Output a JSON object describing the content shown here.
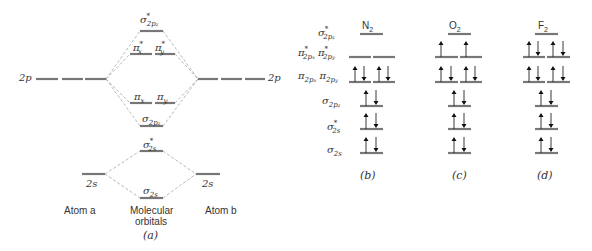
{
  "panel_a": {
    "caption": "(a)",
    "atom_a_label": "Atom a",
    "atom_b_label": "Atom b",
    "molecular_label_line1": "Molecular",
    "molecular_label_line2": "orbitals",
    "atomic_levels": {
      "left_2p": "2p",
      "right_2p": "2p",
      "left_2s": "2s",
      "right_2s": "2s"
    },
    "mo_levels": [
      {
        "name": "sigma*2pz",
        "label": "σ",
        "sub": "2p",
        "subsub": "z",
        "star": true
      },
      {
        "name": "pi*x",
        "label": "π",
        "sub": "x",
        "star": true
      },
      {
        "name": "pi*y",
        "label": "π",
        "sub": "y",
        "star": true
      },
      {
        "name": "pi x",
        "label": "π",
        "sub": "x",
        "star": false
      },
      {
        "name": "pi y",
        "label": "π",
        "sub": "y",
        "star": false
      },
      {
        "name": "sigma2pz",
        "label": "σ",
        "sub": "2p",
        "subsub": "z",
        "star": false
      },
      {
        "name": "sigma*2s",
        "label": "σ",
        "sub": "2s",
        "star": true
      },
      {
        "name": "sigma2s",
        "label": "σ",
        "sub": "2s",
        "star": false
      }
    ]
  },
  "row_labels": {
    "sigma_star_2pz": "σ*2pz",
    "pi_star": "π*2px π*2py",
    "pi": "π2px π2py",
    "sigma_2pz": "σ2pz",
    "sigma_star_2s": "σ*2s",
    "sigma_2s": "σ2s"
  },
  "molecules": [
    {
      "formula": "N",
      "subscript": "2",
      "caption": "(b)",
      "occupancy": {
        "sigma_star_2pz": 0,
        "pi_star": [
          0,
          0
        ],
        "pi": [
          2,
          2
        ],
        "sigma_2pz": 2,
        "sigma_star_2s": 2,
        "sigma_2s": 2
      }
    },
    {
      "formula": "O",
      "subscript": "2",
      "caption": "(c)",
      "occupancy": {
        "sigma_star_2pz": 0,
        "pi_star": [
          1,
          1
        ],
        "pi": [
          2,
          2
        ],
        "sigma_2pz": 2,
        "sigma_star_2s": 2,
        "sigma_2s": 2
      }
    },
    {
      "formula": "F",
      "subscript": "2",
      "caption": "(d)",
      "occupancy": {
        "sigma_star_2pz": 0,
        "pi_star": [
          2,
          2
        ],
        "pi": [
          2,
          2
        ],
        "sigma_2pz": 2,
        "sigma_star_2s": 2,
        "sigma_2s": 2
      }
    }
  ]
}
